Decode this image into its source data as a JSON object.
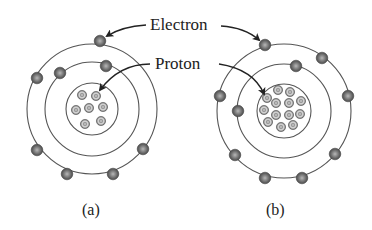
{
  "labels": {
    "electron": "Electron",
    "proton": "Proton",
    "atom_a": "(a)",
    "atom_b": "(b)"
  },
  "colors": {
    "orbit": "#555555",
    "particle": "#6b6b6b",
    "particle_highlight": "#b0b0b0",
    "text": "#222222"
  },
  "atoms": [
    {
      "id": "a",
      "center": [
        92,
        109
      ],
      "orbits": [
        26,
        47,
        65
      ],
      "electrons": [
        [
          100,
          41
        ],
        [
          37,
          78
        ],
        [
          37,
          150
        ],
        [
          67,
          174
        ],
        [
          113,
          174
        ],
        [
          143,
          149
        ],
        [
          60,
          73
        ],
        [
          106,
          66
        ]
      ],
      "protons": [
        [
          82,
          95
        ],
        [
          96,
          96
        ],
        [
          76,
          110
        ],
        [
          89,
          108
        ],
        [
          103,
          107
        ],
        [
          85,
          124
        ],
        [
          101,
          121
        ]
      ]
    },
    {
      "id": "b",
      "center": [
        284,
        111
      ],
      "orbits": [
        27,
        47,
        67
      ],
      "electrons": [
        [
          265,
          45
        ],
        [
          322,
          58
        ],
        [
          348,
          96
        ],
        [
          220,
          96
        ],
        [
          235,
          155
        ],
        [
          265,
          178
        ],
        [
          302,
          178
        ],
        [
          335,
          154
        ],
        [
          296,
          66
        ],
        [
          238,
          111
        ]
      ],
      "protons": [
        [
          278,
          90
        ],
        [
          290,
          92
        ],
        [
          267,
          98
        ],
        [
          276,
          103
        ],
        [
          289,
          103
        ],
        [
          301,
          101
        ],
        [
          264,
          110
        ],
        [
          276,
          115
        ],
        [
          289,
          115
        ],
        [
          300,
          114
        ],
        [
          268,
          122
        ],
        [
          281,
          127
        ],
        [
          293,
          125
        ]
      ]
    }
  ]
}
